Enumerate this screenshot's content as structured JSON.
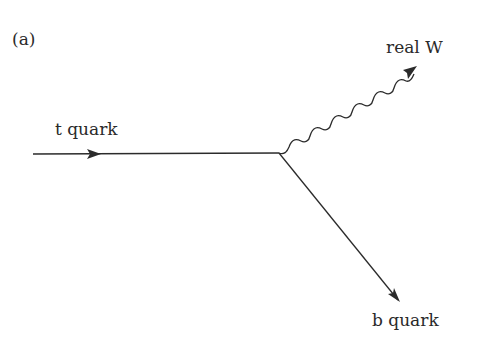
{
  "diagram": {
    "panel_label": "(a)",
    "particles": {
      "incoming": "t quark",
      "boson": "real W",
      "outgoing": "b quark"
    },
    "line_color": "#2b2b2b"
  }
}
